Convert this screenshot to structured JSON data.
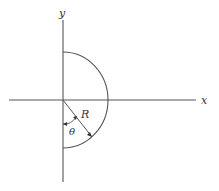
{
  "diagram": {
    "type": "geometry",
    "labels": {
      "x_axis": "x",
      "y_axis": "y",
      "radius": "R",
      "angle": "θ"
    },
    "colors": {
      "line": "#555555",
      "text": "#333333",
      "background": "#ffffff"
    }
  }
}
